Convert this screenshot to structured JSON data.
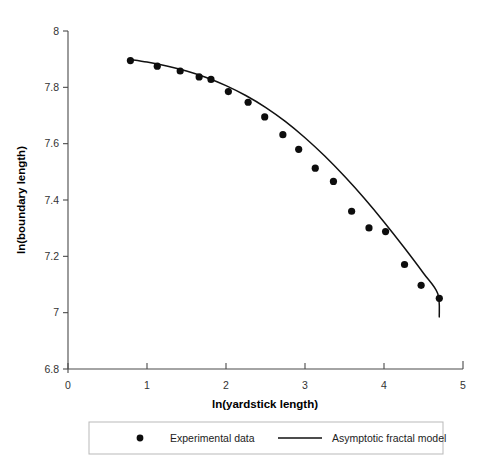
{
  "chart_data": {
    "type": "scatter",
    "title": "",
    "xlabel": "ln(yardstick length)",
    "ylabel": "ln(boundary length)",
    "xlim": [
      0,
      5
    ],
    "ylim": [
      6.8,
      8.0
    ],
    "xticks": [
      "0",
      "1",
      "2",
      "3",
      "4",
      "5"
    ],
    "yticks": [
      "6.8",
      "7",
      "7.2",
      "7.4",
      "7.6",
      "7.8",
      "8"
    ],
    "xtick_values": [
      0,
      1,
      2,
      3,
      4,
      5
    ],
    "ytick_values": [
      6.8,
      7.0,
      7.2,
      7.4,
      7.6,
      7.8,
      8.0
    ],
    "grid": false,
    "legend_position": "below-plot",
    "series": [
      {
        "name": "Experimental data",
        "type": "scatter",
        "marker": "circle",
        "color": "#0d0d0d",
        "points": [
          {
            "x": 0.79,
            "y": 7.895
          },
          {
            "x": 1.13,
            "y": 7.875
          },
          {
            "x": 1.42,
            "y": 7.858
          },
          {
            "x": 1.66,
            "y": 7.837
          },
          {
            "x": 1.81,
            "y": 7.828
          },
          {
            "x": 2.03,
            "y": 7.785
          },
          {
            "x": 2.28,
            "y": 7.747
          },
          {
            "x": 2.49,
            "y": 7.695
          },
          {
            "x": 2.72,
            "y": 7.632
          },
          {
            "x": 2.92,
            "y": 7.58
          },
          {
            "x": 3.13,
            "y": 7.513
          },
          {
            "x": 3.36,
            "y": 7.466
          },
          {
            "x": 3.59,
            "y": 7.36
          },
          {
            "x": 3.81,
            "y": 7.301
          },
          {
            "x": 4.02,
            "y": 7.288
          },
          {
            "x": 4.26,
            "y": 7.171
          },
          {
            "x": 4.47,
            "y": 7.097
          },
          {
            "x": 4.7,
            "y": 7.051
          }
        ]
      },
      {
        "name": "Asymptotic fractal model",
        "type": "line",
        "color": "#111111",
        "points": [
          {
            "x": 0.79,
            "y": 7.899
          },
          {
            "x": 1.0,
            "y": 7.89
          },
          {
            "x": 1.25,
            "y": 7.876
          },
          {
            "x": 1.5,
            "y": 7.858
          },
          {
            "x": 1.75,
            "y": 7.835
          },
          {
            "x": 2.0,
            "y": 7.806
          },
          {
            "x": 2.25,
            "y": 7.771
          },
          {
            "x": 2.5,
            "y": 7.729
          },
          {
            "x": 2.75,
            "y": 7.679
          },
          {
            "x": 3.0,
            "y": 7.621
          },
          {
            "x": 3.25,
            "y": 7.556
          },
          {
            "x": 3.5,
            "y": 7.484
          },
          {
            "x": 3.75,
            "y": 7.406
          },
          {
            "x": 4.0,
            "y": 7.322
          },
          {
            "x": 4.25,
            "y": 7.233
          },
          {
            "x": 4.5,
            "y": 7.14
          },
          {
            "x": 4.68,
            "y": 7.068
          },
          {
            "x": 4.7,
            "y": 6.985
          }
        ]
      }
    ]
  },
  "axes": {
    "y_title": "ln(boundary length)",
    "x_title": "ln(yardstick length)",
    "y_tick_labels": [
      "8",
      "7.8",
      "7.6",
      "7.4",
      "7.2",
      "7",
      "6.8"
    ],
    "x_tick_labels": [
      "0",
      "1",
      "2",
      "3",
      "4",
      "5"
    ]
  },
  "legend": {
    "items": [
      {
        "label": "Experimental data",
        "marker": "circle"
      },
      {
        "label": "Asymptotic fractal model",
        "marker": "line"
      }
    ]
  },
  "colors": {
    "axis": "#4a4a4a",
    "data": "#0d0d0d",
    "model": "#111111",
    "legend_border": "#b9b9b9",
    "background": "#ffffff"
  }
}
